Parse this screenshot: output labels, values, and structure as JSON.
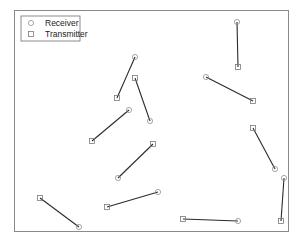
{
  "figure": {
    "title": "",
    "frame": {
      "x": 14,
      "y": 10,
      "width": 274,
      "height": 221
    },
    "colors": {
      "frame": "#8a8a8a",
      "link": "#2b2b2b",
      "receiver_marker": "#8f8f8f",
      "transmitter_marker": "#7a7a7a",
      "background": "#ffffff"
    }
  },
  "legend": {
    "position": "top-left",
    "items": [
      {
        "label": "Receiver",
        "marker": "circle-icon"
      },
      {
        "label": "Transmitter",
        "marker": "square-icon"
      }
    ]
  },
  "chart_data": {
    "type": "scatter",
    "title": "",
    "xlabel": "",
    "ylabel": "",
    "axes_visible": false,
    "grid": false,
    "legend_position": "upper-left",
    "coordinate_system": "image pixels (origin top-left)",
    "series": [
      {
        "name": "Receiver",
        "marker": "circle"
      },
      {
        "name": "Transmitter",
        "marker": "square"
      }
    ],
    "links": [
      {
        "id": 1,
        "receiver": [
          135,
          57
        ],
        "transmitter": [
          117,
          98
        ]
      },
      {
        "id": 2,
        "receiver": [
          150,
          121
        ],
        "transmitter": [
          135,
          78
        ]
      },
      {
        "id": 3,
        "receiver": [
          129,
          110
        ],
        "transmitter": [
          92,
          141
        ]
      },
      {
        "id": 4,
        "receiver": [
          118,
          178
        ],
        "transmitter": [
          153,
          144
        ]
      },
      {
        "id": 5,
        "receiver": [
          158,
          192
        ],
        "transmitter": [
          107,
          207
        ]
      },
      {
        "id": 6,
        "receiver": [
          79,
          227
        ],
        "transmitter": [
          40,
          198
        ]
      },
      {
        "id": 7,
        "receiver": [
          238,
          221
        ],
        "transmitter": [
          183,
          219
        ]
      },
      {
        "id": 8,
        "receiver": [
          237,
          22
        ],
        "transmitter": [
          238,
          67
        ]
      },
      {
        "id": 9,
        "receiver": [
          206,
          77
        ],
        "transmitter": [
          253,
          101
        ]
      },
      {
        "id": 10,
        "receiver": [
          275,
          169
        ],
        "transmitter": [
          253,
          128
        ]
      },
      {
        "id": 11,
        "receiver": [
          284,
          178
        ],
        "transmitter": [
          281,
          221
        ]
      }
    ]
  }
}
